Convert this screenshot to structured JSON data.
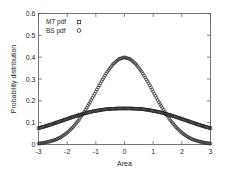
{
  "chart_data": {
    "type": "scatter",
    "title": "",
    "xlabel": "Area",
    "ylabel": "Probability distribution",
    "xlim": [
      -3,
      3
    ],
    "ylim": [
      0,
      0.6
    ],
    "xticks": [
      "-3",
      "-2",
      "-1",
      "0",
      "1",
      "2",
      "3"
    ],
    "xtick_values": [
      -3,
      -2,
      -1,
      0,
      1,
      2,
      3
    ],
    "yticks": [
      "0",
      "0.1",
      "0.2",
      "0.3",
      "0.4",
      "0.5",
      "0.6"
    ],
    "ytick_values": [
      0,
      0.1,
      0.2,
      0.3,
      0.4,
      0.5,
      0.6
    ],
    "grid": false,
    "legend_position": "top-left",
    "series": [
      {
        "name": "MT pdf",
        "marker": "square",
        "color": "#2b2b2b",
        "x": [
          -3,
          -2.8,
          -2.6,
          -2.4,
          -2.2,
          -2,
          -1.8,
          -1.6,
          -1.4,
          -1.2,
          -1,
          -0.8,
          -0.6,
          -0.4,
          -0.2,
          0,
          0.2,
          0.4,
          0.6,
          0.8,
          1,
          1.2,
          1.4,
          1.6,
          1.8,
          2,
          2.2,
          2.4,
          2.6,
          2.8,
          3
        ],
        "values": [
          0.075,
          0.082,
          0.09,
          0.099,
          0.108,
          0.117,
          0.126,
          0.134,
          0.142,
          0.149,
          0.154,
          0.159,
          0.162,
          0.164,
          0.165,
          0.165,
          0.165,
          0.164,
          0.162,
          0.159,
          0.154,
          0.149,
          0.142,
          0.134,
          0.126,
          0.117,
          0.108,
          0.099,
          0.09,
          0.082,
          0.075
        ]
      },
      {
        "name": "BS pdf",
        "marker": "circle",
        "color": "#2b2b2b",
        "x": [
          -3,
          -2.8,
          -2.6,
          -2.4,
          -2.2,
          -2,
          -1.8,
          -1.6,
          -1.4,
          -1.2,
          -1,
          -0.8,
          -0.6,
          -0.4,
          -0.2,
          0,
          0.2,
          0.4,
          0.6,
          0.8,
          1,
          1.2,
          1.4,
          1.6,
          1.8,
          2,
          2.2,
          2.4,
          2.6,
          2.8,
          3
        ],
        "values": [
          0.004,
          0.008,
          0.014,
          0.022,
          0.035,
          0.054,
          0.079,
          0.111,
          0.15,
          0.194,
          0.242,
          0.29,
          0.333,
          0.368,
          0.391,
          0.399,
          0.391,
          0.368,
          0.333,
          0.29,
          0.242,
          0.194,
          0.15,
          0.111,
          0.079,
          0.054,
          0.035,
          0.022,
          0.014,
          0.008,
          0.004
        ]
      }
    ]
  },
  "legend": {
    "entries": [
      {
        "label": "MT pdf",
        "marker": "square-marker"
      },
      {
        "label": "BS pdf",
        "marker": "circle-marker"
      }
    ]
  }
}
